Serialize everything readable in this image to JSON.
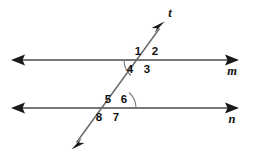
{
  "figure": {
    "background_color": "#ffffff",
    "line_color": "#4a4a4a",
    "label_color": "#111111",
    "arc_color": "#7a7a7a"
  },
  "lines": {
    "upper": {
      "name": "m",
      "label": "m",
      "label_x": 232,
      "label_y": 72,
      "y": 60,
      "x_start": 12,
      "x_end": 238,
      "arrow_left": true,
      "arrow_right": true
    },
    "lower": {
      "name": "n",
      "label": "n",
      "label_x": 232,
      "label_y": 120,
      "y": 108,
      "x_start": 12,
      "x_end": 238,
      "arrow_left": true,
      "arrow_right": true
    },
    "transversal": {
      "name": "t",
      "label": "t",
      "label_x": 170,
      "label_y": 14,
      "x_top": 164,
      "y_top": 22,
      "x_bottom": 71,
      "y_bottom": 150,
      "arrow_top": true,
      "arrow_bottom": true
    }
  },
  "intersections": [
    {
      "id": "upper-intersection",
      "line": "m",
      "x": 145,
      "y": 60,
      "arc": {
        "present": true,
        "side": "left-below",
        "radius": 21,
        "covers_angle": "4"
      }
    },
    {
      "id": "lower-intersection",
      "line": "n",
      "x": 115,
      "y": 108,
      "arc": {
        "present": true,
        "side": "right-above",
        "radius": 21,
        "covers_angle": "6"
      }
    }
  ],
  "angle_labels": [
    {
      "label": "1",
      "x": 138,
      "y": 52,
      "position": "upper-left-of-upper-intersection"
    },
    {
      "label": "2",
      "x": 155,
      "y": 52,
      "position": "upper-right-of-upper-intersection"
    },
    {
      "label": "3",
      "x": 147,
      "y": 70,
      "position": "lower-right-of-upper-intersection"
    },
    {
      "label": "4",
      "x": 130,
      "y": 70,
      "position": "lower-left-of-upper-intersection"
    },
    {
      "label": "5",
      "x": 108,
      "y": 100,
      "position": "upper-left-of-lower-intersection"
    },
    {
      "label": "6",
      "x": 124,
      "y": 100,
      "position": "upper-right-of-lower-intersection"
    },
    {
      "label": "7",
      "x": 116,
      "y": 118,
      "position": "lower-right-of-lower-intersection"
    },
    {
      "label": "8",
      "x": 99,
      "y": 118,
      "position": "lower-left-of-lower-intersection"
    }
  ]
}
